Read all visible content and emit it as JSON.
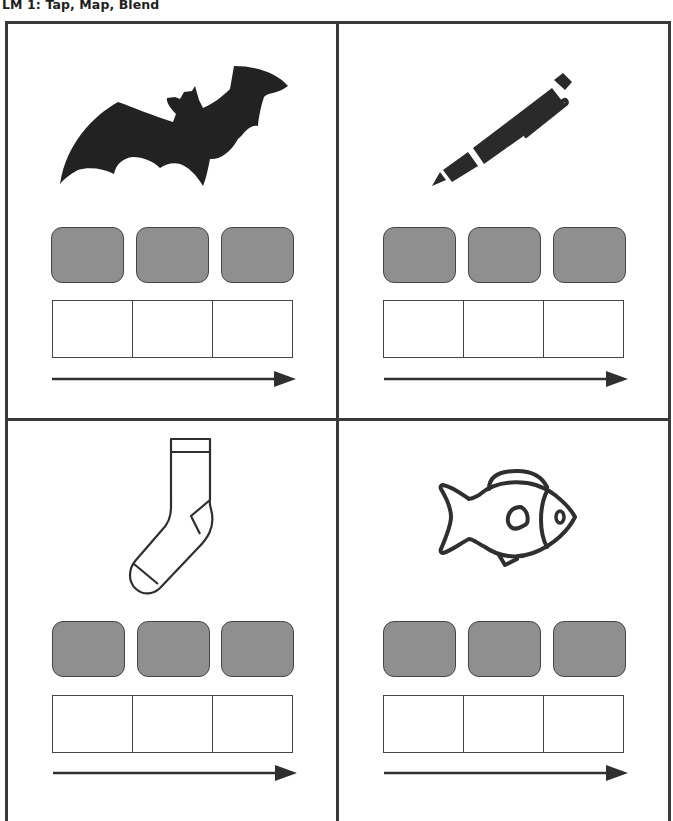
{
  "header": {
    "title": "LM 1: Tap, Map, Blend"
  },
  "style": {
    "tile_color": "#8f8f8f",
    "line_color": "#3a3a3a",
    "icon_color": "#2a2a2a"
  },
  "cards": [
    {
      "id": "bat",
      "picture": "bat-icon",
      "picture_style": "filled silhouette",
      "sound_tiles": 3,
      "letter_boxes": 3,
      "arrow": "left-to-right"
    },
    {
      "id": "pen",
      "picture": "pen-icon",
      "picture_style": "filled",
      "sound_tiles": 3,
      "letter_boxes": 3,
      "arrow": "left-to-right"
    },
    {
      "id": "sock",
      "picture": "sock-icon",
      "picture_style": "outline",
      "sound_tiles": 3,
      "letter_boxes": 3,
      "arrow": "left-to-right"
    },
    {
      "id": "fish",
      "picture": "fish-icon",
      "picture_style": "outline",
      "sound_tiles": 3,
      "letter_boxes": 3,
      "arrow": "left-to-right"
    }
  ]
}
